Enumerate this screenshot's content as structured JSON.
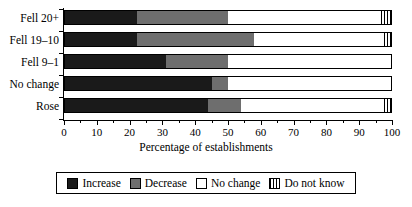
{
  "chart_data": {
    "type": "bar",
    "title": "",
    "subtitle": "",
    "orientation": "horizontal",
    "stacked": true,
    "xlabel": "Percentage of establishments",
    "ylabel": "",
    "xlim": [
      0,
      100
    ],
    "grid": false,
    "legend_position": "bottom",
    "categories": [
      "Fell 20+",
      "Fell 19–10",
      "Fell 9–1",
      "No change",
      "Rose"
    ],
    "xticks": [
      0,
      10,
      20,
      30,
      40,
      50,
      60,
      70,
      80,
      90,
      100
    ],
    "xtick_labels": [
      "0",
      "10",
      "20",
      "30",
      "40",
      "50",
      "60",
      "70",
      "80",
      "90",
      "100"
    ],
    "series": [
      {
        "name": "Increase",
        "color": "#1a1a1a",
        "values": [
          22,
          22,
          31,
          45,
          44
        ]
      },
      {
        "name": "Decrease",
        "color": "#6e6e6e",
        "values": [
          28,
          36,
          19,
          5,
          10
        ]
      },
      {
        "name": "No change",
        "color": "#ffffff",
        "values": [
          47,
          40,
          50,
          50,
          44
        ]
      },
      {
        "name": "Do not know",
        "color": "hatch",
        "values": [
          3,
          2,
          0,
          0,
          2
        ]
      }
    ]
  },
  "axis": {
    "x_title": "Percentage of establishments"
  },
  "legend": {
    "items": [
      {
        "label": "Increase",
        "swatch": "solid-black"
      },
      {
        "label": "Decrease",
        "swatch": "solid-gray"
      },
      {
        "label": "No change",
        "swatch": "outline-white"
      },
      {
        "label": "Do not know",
        "swatch": "vertical-hatch"
      }
    ]
  },
  "labels": {
    "cat0": "Fell 20+",
    "cat1": "Fell 19–10",
    "cat2": "Fell 9–1",
    "cat3": "No change",
    "cat4": "Rose"
  },
  "ticks": {
    "t0": "0",
    "t1": "10",
    "t2": "20",
    "t3": "30",
    "t4": "40",
    "t5": "50",
    "t6": "60",
    "t7": "70",
    "t8": "80",
    "t9": "90",
    "t10": "100"
  }
}
